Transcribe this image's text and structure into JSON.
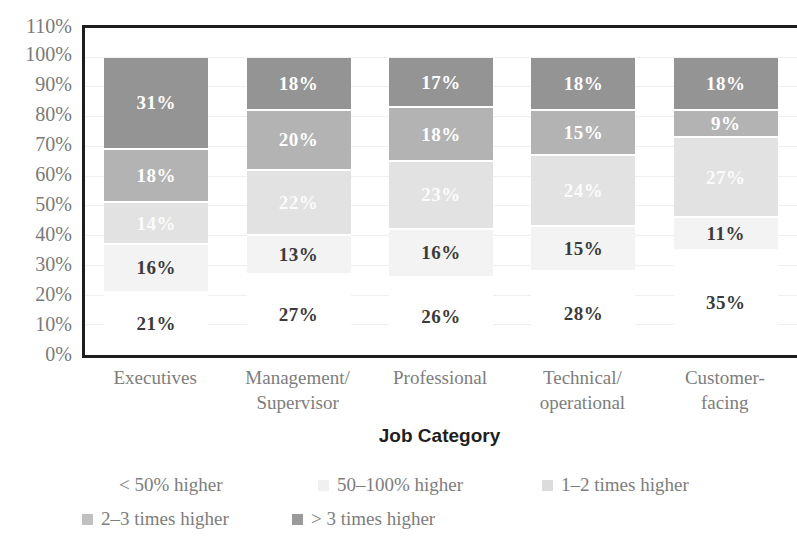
{
  "chart_data": {
    "type": "bar",
    "subtype": "stacked-percent",
    "title": "",
    "xlabel": "Job Category",
    "ylabel": "",
    "ylim": [
      0,
      110
    ],
    "ytick_step": 10,
    "grid": true,
    "legend_position": "bottom",
    "categories": [
      "Executives",
      "Management/ Supervisor",
      "Professional",
      "Technical/ operational",
      "Customer- facing"
    ],
    "category_lines": [
      [
        "Executives",
        ""
      ],
      [
        "Management/",
        "Supervisor"
      ],
      [
        "Professional",
        ""
      ],
      [
        "Technical/",
        "operational"
      ],
      [
        "Customer-",
        "facing"
      ]
    ],
    "series": [
      {
        "name": "< 50% higher",
        "color": "#ffffff",
        "text_color": "#3b3b3b",
        "values": [
          21,
          27,
          26,
          28,
          35
        ],
        "labels": [
          "21%",
          "27%",
          "26%",
          "28%",
          "35%"
        ]
      },
      {
        "name": "50–100% higher",
        "color": "#f3f3f3",
        "text_color": "#3b3b3b",
        "values": [
          16,
          13,
          16,
          15,
          11
        ],
        "labels": [
          "16%",
          "13%",
          "16%",
          "15%",
          "11%"
        ]
      },
      {
        "name": "1–2 times higher",
        "color": "#e2e2e2",
        "text_color": "#fbfbfb",
        "values": [
          14,
          22,
          23,
          24,
          27
        ],
        "labels": [
          "14%",
          "22%",
          "23%",
          "24%",
          "27%"
        ]
      },
      {
        "name": "2–3 times higher",
        "color": "#b3b3b3",
        "text_color": "#ffffff",
        "values": [
          18,
          20,
          18,
          15,
          9
        ],
        "labels": [
          "18%",
          "20%",
          "18%",
          "15%",
          "9%"
        ]
      },
      {
        "name": "> 3 times higher",
        "color": "#949494",
        "text_color": "#ffffff",
        "values": [
          31,
          18,
          17,
          18,
          18
        ],
        "labels": [
          "31%",
          "18%",
          "17%",
          "18%",
          "18%"
        ]
      }
    ],
    "yticks": [
      "110%",
      "100%",
      "90%",
      "80%",
      "70%",
      "60%",
      "50%",
      "40%",
      "30%",
      "20%",
      "10%",
      "0%"
    ]
  },
  "axis": {
    "y_ticks": [
      "110%",
      "100%",
      "90%",
      "80%",
      "70%",
      "60%",
      "50%",
      "40%",
      "30%",
      "20%",
      "10%",
      "0%"
    ],
    "x_title": "Job Category"
  },
  "legend": {
    "items": [
      {
        "label": "< 50% higher",
        "swatch": "#ffffff"
      },
      {
        "label": "50–100% higher",
        "swatch": "#f0f0f0"
      },
      {
        "label": "1–2 times higher",
        "swatch": "#dcdcdc"
      },
      {
        "label": "2–3 times higher",
        "swatch": "#c0c0c0"
      },
      {
        "label": "> 3 times higher",
        "swatch": "#9a9a9a"
      }
    ]
  }
}
